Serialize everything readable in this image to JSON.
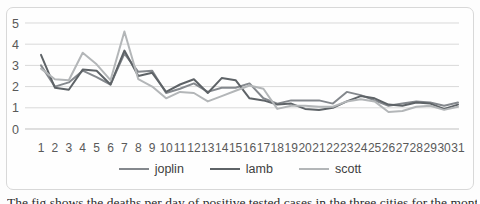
{
  "figure": {
    "caption_clipped_text": "The fig shows the deaths per day of positive tested cases in the three cities for the month."
  },
  "chart_data": {
    "type": "line",
    "x": [
      1,
      2,
      3,
      4,
      5,
      6,
      7,
      8,
      9,
      10,
      11,
      12,
      13,
      14,
      15,
      16,
      17,
      18,
      19,
      20,
      21,
      22,
      23,
      24,
      25,
      26,
      27,
      28,
      29,
      30,
      31
    ],
    "series": [
      {
        "name": "joplin",
        "color": "#84888d",
        "values": [
          3.0,
          2.0,
          2.2,
          2.75,
          2.45,
          2.1,
          3.55,
          2.7,
          2.75,
          1.7,
          1.9,
          2.15,
          1.75,
          1.95,
          1.95,
          2.15,
          1.45,
          1.2,
          1.35,
          1.35,
          1.35,
          1.2,
          1.75,
          1.6,
          1.35,
          1.1,
          1.2,
          1.3,
          1.25,
          1.1,
          1.25
        ]
      },
      {
        "name": "lamb",
        "color": "#5e6367",
        "values": [
          3.5,
          1.95,
          1.85,
          2.8,
          2.75,
          2.1,
          3.7,
          2.5,
          2.65,
          1.75,
          2.1,
          2.35,
          1.7,
          2.4,
          2.3,
          1.45,
          1.35,
          1.15,
          1.2,
          0.95,
          0.9,
          1.0,
          1.3,
          1.55,
          1.45,
          1.15,
          1.1,
          1.25,
          1.2,
          0.95,
          1.15
        ]
      },
      {
        "name": "scott",
        "color": "#b3b6b8",
        "values": [
          2.85,
          2.35,
          2.3,
          3.6,
          3.05,
          2.3,
          4.6,
          2.35,
          2.0,
          1.45,
          1.75,
          1.7,
          1.3,
          1.55,
          1.8,
          2.05,
          1.9,
          0.95,
          1.1,
          1.1,
          1.05,
          1.05,
          1.3,
          1.4,
          1.3,
          0.8,
          0.85,
          1.05,
          1.1,
          0.9,
          1.05
        ]
      }
    ],
    "title": "",
    "xlabel": "",
    "ylabel": "",
    "ylim": [
      0,
      5
    ],
    "yticks": [
      0,
      1,
      2,
      3,
      4,
      5
    ],
    "grid": true,
    "legend_position": "bottom",
    "style": {
      "gridline_color": "#d9d9d9",
      "axis_line_color": "#bfbfbf",
      "tick_label_color": "#595959",
      "legend_label_color": "#404040",
      "frame_border_color": "#d8d8d8"
    }
  }
}
